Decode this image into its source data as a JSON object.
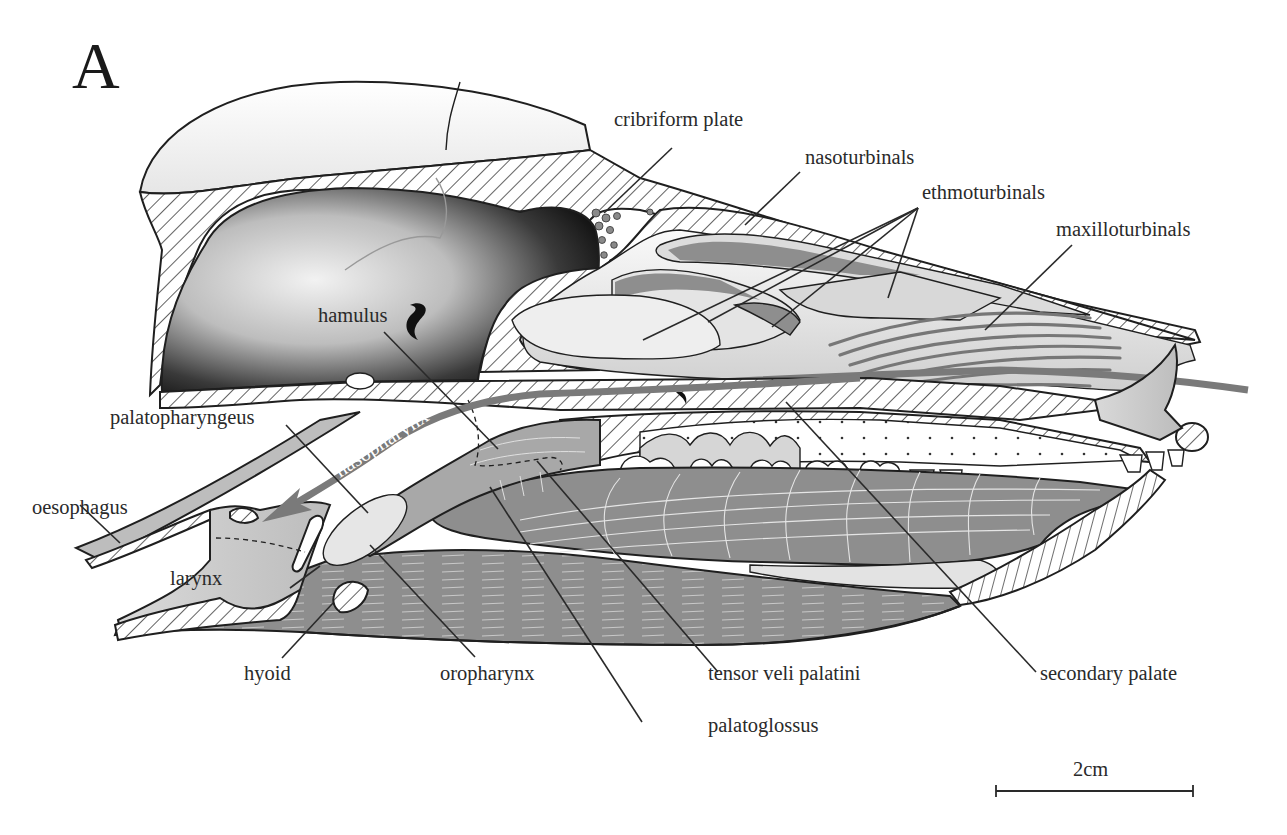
{
  "figure": {
    "panel_letter": "A",
    "labels": {
      "cribriform_plate": "cribriform plate",
      "nasoturbinals": "nasoturbinals",
      "ethmoturbinals": "ethmoturbinals",
      "maxilloturbinals": "maxilloturbinals",
      "hamulus": "hamulus",
      "palatopharyngeus": "palatopharyngeus",
      "nasopharynx": "nasopharynx",
      "oesophagus": "oesophagus",
      "larynx": "larynx",
      "hyoid": "hyoid",
      "oropharynx": "oropharynx",
      "tensor_veli_palatini": "tensor veli palatini",
      "palatoglossus": "palatoglossus",
      "secondary_palate": "secondary palate"
    },
    "scale_bar": {
      "label": "2cm"
    },
    "colors": {
      "bone_hatch": "#1f1f1f",
      "muscle_gray": "#8c8c8c",
      "airflow_arrow": "#7a7a7a",
      "cavity_dark": "#2b2b2b",
      "background": "#ffffff"
    }
  }
}
